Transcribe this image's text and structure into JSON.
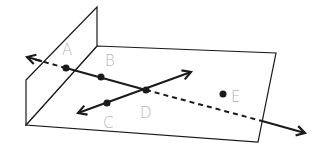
{
  "diagram": {
    "points": [
      {
        "label": "A",
        "x": 66,
        "y": 68,
        "lx": 62,
        "ly": 55
      },
      {
        "label": "B",
        "x": 101,
        "y": 77,
        "lx": 105,
        "ly": 66
      },
      {
        "label": "C",
        "x": 107,
        "y": 103,
        "lx": 103,
        "ly": 128
      },
      {
        "label": "D",
        "x": 146,
        "y": 90,
        "lx": 140,
        "ly": 118
      },
      {
        "label": "E",
        "x": 223,
        "y": 94,
        "lx": 231,
        "ly": 102
      }
    ],
    "colors": {
      "line": "#1a1a1a",
      "label": "#b5b5b5",
      "background": "#ffffff"
    }
  }
}
